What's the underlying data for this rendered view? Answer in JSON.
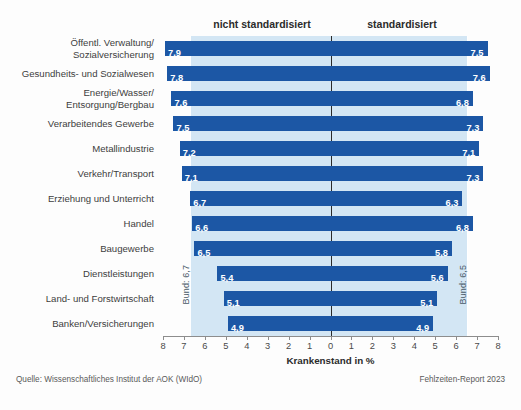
{
  "header": {
    "left_label": "nicht standardisiert",
    "right_label": "standardisiert"
  },
  "footer": {
    "source": "Quelle: Wissenschaftliches Institut der AOK (WIdO)",
    "report": "Fehlzeiten-Report 2023"
  },
  "annotations": {
    "bund_left": "Bund: 6,7",
    "bund_right": "Bund: 6,5"
  },
  "colors": {
    "bar": "#1c57a5",
    "band": "#d3e6f4",
    "axis": "#8d8d8d",
    "value_text": "#ffffff"
  },
  "chart_data": {
    "type": "bar",
    "title": "",
    "subtitle": "",
    "xlabel": "Krankenstand in %",
    "ylabel": "",
    "orientation": "horizontal",
    "layout": "diverging",
    "grid": false,
    "legend_position": "top",
    "axis_ticks": [
      "8",
      "7",
      "6",
      "5",
      "4",
      "3",
      "2",
      "1",
      "0",
      "1",
      "2",
      "3",
      "4",
      "5",
      "6",
      "7",
      "8"
    ],
    "axis_left_max": 8,
    "axis_right_max": 8,
    "categories": [
      "Öffentl. Verwaltung/\nSozialversicherung",
      "Gesundheits- und Sozialwesen",
      "Energie/Wasser/\nEntsorgung/Bergbau",
      "Verarbeitendes Gewerbe",
      "Metallindustrie",
      "Verkehr/Transport",
      "Erziehung und Unterricht",
      "Handel",
      "Baugewerbe",
      "Dienstleistungen",
      "Land- und Forstwirtschaft",
      "Banken/Versicherungen"
    ],
    "series": [
      {
        "name": "nicht standardisiert",
        "side": "left",
        "values": [
          7.9,
          7.8,
          7.6,
          7.5,
          7.2,
          7.1,
          6.7,
          6.6,
          6.5,
          5.4,
          5.1,
          4.9
        ],
        "labels": [
          "7,9",
          "7,8",
          "7,6",
          "7,5",
          "7,2",
          "7,1",
          "6,7",
          "6,6",
          "6,5",
          "5,4",
          "5,1",
          "4,9"
        ],
        "reference_line": 6.7,
        "reference_label": "Bund: 6,7"
      },
      {
        "name": "standardisiert",
        "side": "right",
        "values": [
          7.5,
          7.6,
          6.8,
          7.3,
          7.1,
          7.3,
          6.3,
          6.8,
          5.8,
          5.6,
          5.1,
          4.9
        ],
        "labels": [
          "7,5",
          "7,6",
          "6,8",
          "7,3",
          "7,1",
          "7,3",
          "6,3",
          "6,8",
          "5,8",
          "5,6",
          "5,1",
          "4,9"
        ],
        "reference_line": 6.5,
        "reference_label": "Bund: 6,5"
      }
    ]
  }
}
